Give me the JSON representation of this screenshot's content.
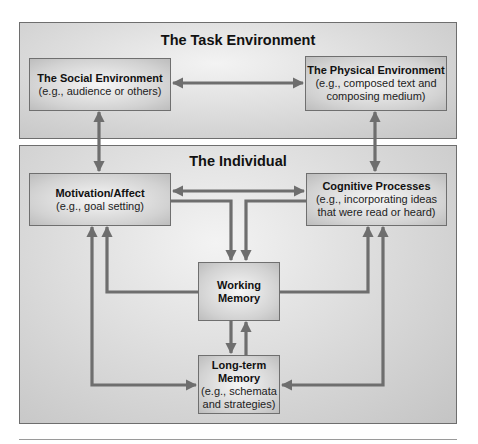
{
  "diagram": {
    "task_environment": {
      "title": "The Task Environment",
      "social": {
        "title": "The Social Environment",
        "subtitle": "(e.g., audience or others)"
      },
      "physical": {
        "title": "The Physical Environment",
        "subtitle_line1": "(e.g., composed text and",
        "subtitle_line2": "composing medium)"
      }
    },
    "individual": {
      "title": "The Individual",
      "motivation": {
        "title": "Motivation/Affect",
        "subtitle": "(e.g., goal setting)"
      },
      "cognitive": {
        "title": "Cognitive Processes",
        "subtitle_line1": "(e.g., incorporating ideas",
        "subtitle_line2": "that were read or heard)"
      },
      "working_memory": {
        "title_line1": "Working",
        "title_line2": "Memory"
      },
      "long_term_memory": {
        "title_line1": "Long-term",
        "title_line2": "Memory",
        "subtitle_line1": "(e.g., schemata",
        "subtitle_line2": "and strategies)"
      }
    },
    "connections": [
      {
        "from": "Social Environment",
        "to": "Physical Environment",
        "type": "bidirectional"
      },
      {
        "from": "Social Environment",
        "to": "Motivation/Affect",
        "type": "bidirectional"
      },
      {
        "from": "Physical Environment",
        "to": "Cognitive Processes",
        "type": "bidirectional"
      },
      {
        "from": "Motivation/Affect",
        "to": "Cognitive Processes",
        "type": "bidirectional"
      },
      {
        "from": "Motivation/Affect",
        "to": "Working Memory",
        "type": "directed"
      },
      {
        "from": "Cognitive Processes",
        "to": "Working Memory",
        "type": "directed"
      },
      {
        "from": "Working Memory",
        "to": "Motivation/Affect",
        "type": "directed"
      },
      {
        "from": "Working Memory",
        "to": "Cognitive Processes",
        "type": "directed"
      },
      {
        "from": "Working Memory",
        "to": "Long-term Memory",
        "type": "directed"
      },
      {
        "from": "Long-term Memory",
        "to": "Working Memory",
        "type": "directed"
      },
      {
        "from": "Motivation/Affect",
        "to": "Long-term Memory",
        "type": "bidirectional"
      },
      {
        "from": "Cognitive Processes",
        "to": "Long-term Memory",
        "type": "bidirectional"
      }
    ],
    "colors": {
      "arrow": "#6e6e6e",
      "border": "#6e6e6e",
      "fill_light": "#f3f3f3",
      "fill_dark": "#c4c4c4"
    }
  }
}
